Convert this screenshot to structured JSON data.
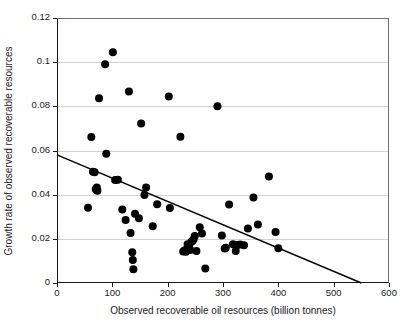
{
  "chart_data": {
    "type": "scatter",
    "title": "",
    "xlabel": "Observed recoverable oil resources (billion tonnes)",
    "ylabel": "Growth rate of observed recoverable resources",
    "xlim": [
      0,
      600
    ],
    "ylim": [
      0,
      0.12
    ],
    "xticks": [
      0,
      100,
      200,
      300,
      400,
      500,
      600
    ],
    "xtick_labels": [
      "0",
      "100",
      "200",
      "300",
      "400",
      "500",
      "600"
    ],
    "yticks": [
      0,
      0.02,
      0.04,
      0.06,
      0.08,
      0.1,
      0.12
    ],
    "ytick_labels": [
      "0",
      "0.02",
      "0.04",
      "0.06",
      "0.08",
      "0.1",
      "0.12"
    ],
    "grid": "horizontal",
    "legend": "none",
    "marker_color": "#000000",
    "marker_size": 4.0,
    "line_color": "#000000",
    "series": [
      {
        "name": "Observed growth rate vs recoverable oil resources",
        "marker": "filled-circle",
        "points": [
          [
            56,
            0.0341
          ],
          [
            62,
            0.0661
          ],
          [
            65,
            0.0504
          ],
          [
            68,
            0.0501
          ],
          [
            70,
            0.0425
          ],
          [
            72,
            0.0432
          ],
          [
            73,
            0.0418
          ],
          [
            76,
            0.0837
          ],
          [
            87,
            0.099
          ],
          [
            89,
            0.0585
          ],
          [
            101,
            0.1045
          ],
          [
            105,
            0.0466
          ],
          [
            110,
            0.0468
          ],
          [
            118,
            0.0333
          ],
          [
            124,
            0.0285
          ],
          [
            130,
            0.0867
          ],
          [
            133,
            0.0226
          ],
          [
            136,
            0.0139
          ],
          [
            137,
            0.0104
          ],
          [
            138,
            0.0062
          ],
          [
            141,
            0.0314
          ],
          [
            148,
            0.0293
          ],
          [
            152,
            0.0722
          ],
          [
            158,
            0.0398
          ],
          [
            161,
            0.0433
          ],
          [
            173,
            0.0257
          ],
          [
            181,
            0.0357
          ],
          [
            202,
            0.0845
          ],
          [
            204,
            0.034
          ],
          [
            223,
            0.0662
          ],
          [
            228,
            0.0143
          ],
          [
            231,
            0.0148
          ],
          [
            233,
            0.0141
          ],
          [
            236,
            0.0175
          ],
          [
            239,
            0.0172
          ],
          [
            241,
            0.015
          ],
          [
            243,
            0.0187
          ],
          [
            245,
            0.0191
          ],
          [
            247,
            0.0198
          ],
          [
            249,
            0.0213
          ],
          [
            252,
            0.0145
          ],
          [
            258,
            0.0252
          ],
          [
            262,
            0.0224
          ],
          [
            268,
            0.0066
          ],
          [
            290,
            0.08
          ],
          [
            298,
            0.0215
          ],
          [
            303,
            0.0156
          ],
          [
            305,
            0.016
          ],
          [
            311,
            0.0355
          ],
          [
            318,
            0.0175
          ],
          [
            323,
            0.0145
          ],
          [
            326,
            0.0172
          ],
          [
            331,
            0.0174
          ],
          [
            338,
            0.0171
          ],
          [
            345,
            0.0247
          ],
          [
            355,
            0.0387
          ],
          [
            363,
            0.0265
          ],
          [
            383,
            0.0482
          ],
          [
            395,
            0.0231
          ],
          [
            400,
            0.0157
          ]
        ]
      }
    ],
    "trendline": {
      "type": "linear",
      "x0": 0,
      "y0": 0.058,
      "x1": 550,
      "y1": 0.0
    }
  }
}
